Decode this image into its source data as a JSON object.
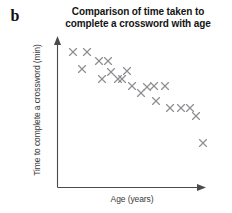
{
  "figure": {
    "panel_letter": "b",
    "title": "Comparison of time taken to complete a crossword with age",
    "title_line1": "Comparison of time taken to",
    "title_line2": "complete a crossword with age"
  },
  "axes": {
    "x_label": "Age (years)",
    "y_label": "Time to complete a crossword (min)",
    "x_ticks": [],
    "y_ticks": [],
    "grid": false,
    "x_arrow": true,
    "y_arrow": true
  },
  "colors": {
    "marker": "#8e8e93",
    "axis": "#4a4a4a",
    "title": "#141414",
    "label": "#3a3a3a",
    "background": "#ffffff"
  },
  "chart_data": {
    "type": "scatter",
    "title": "Comparison of time taken to complete a crossword with age",
    "xlabel": "Age (years)",
    "ylabel": "Time to complete a crossword (min)",
    "xlim": [
      0,
      100
    ],
    "ylim": [
      0,
      100
    ],
    "grid": false,
    "legend": null,
    "marker": "x",
    "n_points": 21,
    "note": "Axes are unscaled (no tick labels); values below are normalised 0-100 positions read off the plot area.",
    "points": [
      {
        "x": 11,
        "y": 90
      },
      {
        "x": 21,
        "y": 90
      },
      {
        "x": 28,
        "y": 83
      },
      {
        "x": 34,
        "y": 83
      },
      {
        "x": 17,
        "y": 78
      },
      {
        "x": 47,
        "y": 74
      },
      {
        "x": 30,
        "y": 71
      },
      {
        "x": 41,
        "y": 71
      },
      {
        "x": 51,
        "y": 66
      },
      {
        "x": 66,
        "y": 66
      },
      {
        "x": 72,
        "y": 66
      },
      {
        "x": 58,
        "y": 61
      },
      {
        "x": 69,
        "y": 57
      },
      {
        "x": 77,
        "y": 53
      },
      {
        "x": 85,
        "y": 53
      },
      {
        "x": 91,
        "y": 53
      },
      {
        "x": 96,
        "y": 47
      },
      {
        "x": 99,
        "y": 36
      },
      {
        "x": 44,
        "y": 71
      },
      {
        "x": 36,
        "y": 74
      },
      {
        "x": 63,
        "y": 61
      }
    ],
    "pixel_points": [
      {
        "px": 73,
        "py": 52
      },
      {
        "px": 87,
        "py": 52
      },
      {
        "px": 99,
        "py": 61
      },
      {
        "px": 108,
        "py": 61
      },
      {
        "px": 82,
        "py": 69
      },
      {
        "px": 127,
        "py": 71
      },
      {
        "px": 102,
        "py": 79
      },
      {
        "px": 118,
        "py": 79
      },
      {
        "px": 132,
        "py": 86
      },
      {
        "px": 154,
        "py": 86
      },
      {
        "px": 165,
        "py": 86
      },
      {
        "px": 141,
        "py": 93
      },
      {
        "px": 156,
        "py": 101
      },
      {
        "px": 170,
        "py": 108
      },
      {
        "px": 181,
        "py": 108
      },
      {
        "px": 190,
        "py": 108
      },
      {
        "px": 196,
        "py": 116
      },
      {
        "px": 203,
        "py": 143
      },
      {
        "px": 122,
        "py": 79
      },
      {
        "px": 111,
        "py": 72
      },
      {
        "px": 147,
        "py": 87
      }
    ]
  }
}
